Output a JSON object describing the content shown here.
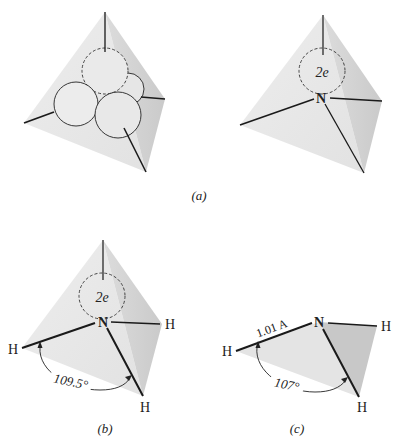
{
  "figure": {
    "panels": [
      {
        "id": "a-left",
        "caption": "",
        "description": "Tetrahedron with four sp3 orbital spheres, one dashed"
      },
      {
        "id": "a-right",
        "caption": "(a)",
        "lone_pair_label": "2e",
        "atom": "N"
      },
      {
        "id": "b",
        "caption": "(b)",
        "lone_pair_label": "2e",
        "atom": "N",
        "hydrogens": [
          "H",
          "H",
          "H"
        ],
        "angle_label": "109.5°"
      },
      {
        "id": "c",
        "caption": "(c)",
        "atom": "N",
        "hydrogens": [
          "H",
          "H",
          "H"
        ],
        "bond_length_label": "1.01 A",
        "angle_label": "107°"
      }
    ],
    "colors": {
      "face_light": "#ececec",
      "face_mid": "#e0e0e0",
      "face_dark": "#cfcfcf",
      "line": "#1a1a1a",
      "background": "#ffffff"
    }
  }
}
